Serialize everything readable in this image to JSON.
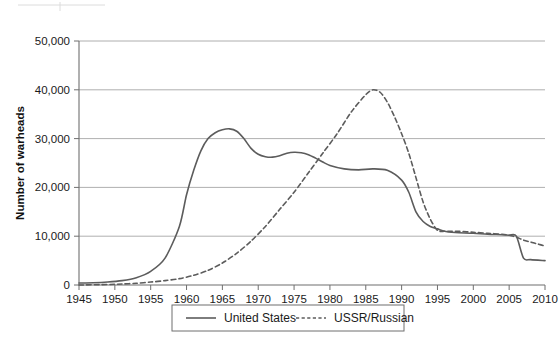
{
  "chart_data": {
    "type": "line",
    "title": "",
    "xlabel": "",
    "ylabel": "Number of warheads",
    "xlim": [
      1945,
      2010
    ],
    "ylim": [
      0,
      50000
    ],
    "grid": true,
    "legend_position": "bottom",
    "x_ticks": [
      1945,
      1950,
      1955,
      1960,
      1965,
      1970,
      1975,
      1980,
      1985,
      1990,
      1995,
      2000,
      2005,
      2010
    ],
    "y_ticks": [
      0,
      10000,
      20000,
      30000,
      40000,
      50000
    ],
    "y_tick_labels": [
      "0",
      "10,000",
      "20,000",
      "30,000",
      "40,000",
      "50,000"
    ],
    "x_tick_labels": [
      "1945",
      "1950",
      "1955",
      "1960",
      "1965",
      "1970",
      "1975",
      "1980",
      "1985",
      "1990",
      "1995",
      "2000",
      "2005",
      "2010"
    ],
    "series": [
      {
        "name": "United States",
        "style": "solid",
        "color": "#5c5c5c",
        "x": [
          1945,
          1947,
          1949,
          1951,
          1953,
          1955,
          1957,
          1959,
          1960,
          1961,
          1962,
          1963,
          1964,
          1965,
          1966,
          1967,
          1968,
          1969,
          1970,
          1971,
          1972,
          1973,
          1974,
          1975,
          1976,
          1977,
          1978,
          1979,
          1980,
          1982,
          1984,
          1986,
          1988,
          1990,
          1991,
          1992,
          1993,
          1994,
          1995,
          1996,
          1997,
          1998,
          2000,
          2002,
          2004,
          2005,
          2006,
          2007,
          2008,
          2010
        ],
        "y": [
          400,
          450,
          600,
          900,
          1500,
          2800,
          5500,
          12000,
          18500,
          23500,
          27500,
          30000,
          31200,
          31800,
          32000,
          31500,
          30000,
          28000,
          26800,
          26300,
          26200,
          26500,
          27000,
          27200,
          27100,
          26700,
          26000,
          25200,
          24500,
          23800,
          23600,
          23800,
          23500,
          21500,
          19000,
          15000,
          13000,
          12000,
          11500,
          11000,
          10800,
          10700,
          10600,
          10400,
          10300,
          10200,
          10000,
          5500,
          5200,
          5000
        ]
      },
      {
        "name": "USSR/Russian",
        "style": "dashed",
        "color": "#5c5c5c",
        "x": [
          1945,
          1949,
          1951,
          1953,
          1955,
          1957,
          1959,
          1961,
          1963,
          1965,
          1967,
          1969,
          1971,
          1973,
          1975,
          1977,
          1979,
          1981,
          1983,
          1985,
          1986,
          1987,
          1988,
          1989,
          1990,
          1991,
          1992,
          1993,
          1994,
          1995,
          1996,
          1997,
          1998,
          2000,
          2002,
          2004,
          2005,
          2006,
          2007,
          2008,
          2009,
          2010
        ],
        "y": [
          0,
          100,
          200,
          350,
          600,
          900,
          1300,
          2000,
          3000,
          4500,
          6500,
          9000,
          12000,
          15500,
          19000,
          23000,
          27000,
          31000,
          35500,
          39000,
          40000,
          39500,
          37500,
          34500,
          31000,
          27000,
          22000,
          17000,
          13500,
          11200,
          11000,
          11000,
          11000,
          10800,
          10600,
          10400,
          10200,
          9800,
          9200,
          8800,
          8400,
          8000
        ]
      }
    ]
  },
  "legend": {
    "items": [
      {
        "label": "United States",
        "style": "solid"
      },
      {
        "label": "USSR/Russian",
        "style": "dashed"
      }
    ]
  },
  "axes": {
    "y_title": "Number of warheads"
  }
}
